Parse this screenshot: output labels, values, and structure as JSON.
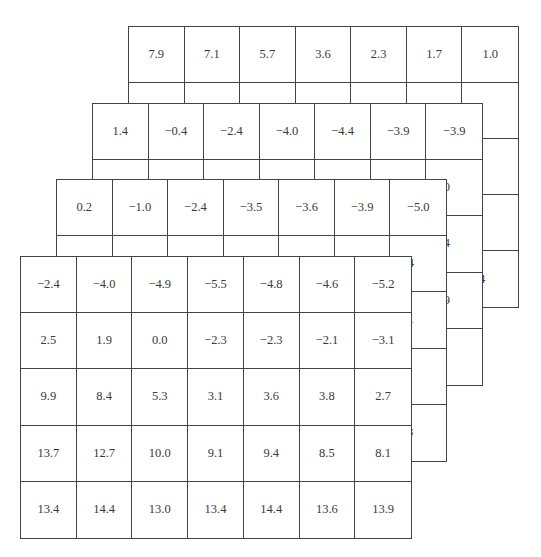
{
  "figure": {
    "layers": [
      {
        "name": "layer-1-back",
        "rows": [
          [
            "7.9",
            "7.1",
            "5.7",
            "3.6",
            "2.3",
            "1.7",
            "1.0"
          ],
          [
            "",
            "",
            "",
            "",
            "",
            "",
            "2.1"
          ],
          [
            "",
            "",
            "",
            "",
            "",
            "",
            "4.0"
          ],
          [
            "",
            "",
            "",
            "",
            "",
            "",
            "6.8"
          ],
          [
            "",
            "",
            "",
            "",
            "",
            "",
            "14.4"
          ]
        ]
      },
      {
        "name": "layer-2",
        "rows": [
          [
            "1.4",
            "−0.4",
            "−2.4",
            "−4.0",
            "−4.4",
            "−3.9",
            "−3.9"
          ],
          [
            "",
            "",
            "",
            "",
            "",
            "",
            "−6.0"
          ],
          [
            "",
            "",
            "",
            "",
            "",
            "",
            "−6.4"
          ],
          [
            "",
            "",
            "",
            "",
            "",
            "",
            "−2.9"
          ],
          [
            "",
            "",
            "",
            "",
            "",
            "",
            "6.6"
          ]
        ]
      },
      {
        "name": "layer-3",
        "rows": [
          [
            "0.2",
            "−1.0",
            "−2.4",
            "−3.5",
            "−3.6",
            "−3.9",
            "−5.0"
          ],
          [
            "",
            "",
            "",
            "",
            "",
            "",
            "−4.4"
          ],
          [
            "",
            "",
            "",
            "",
            "",
            "",
            "−1.1"
          ],
          [
            "",
            "",
            "",
            "",
            "",
            "",
            "2.9"
          ],
          [
            "",
            "",
            "",
            "",
            "",
            "",
            "10.3"
          ]
        ]
      },
      {
        "name": "layer-4-front",
        "rows": [
          [
            "−2.4",
            "−4.0",
            "−4.9",
            "−5.5",
            "−4.8",
            "−4.6",
            "−5.2"
          ],
          [
            "2.5",
            "1.9",
            "0.0",
            "−2.3",
            "−2.3",
            "−2.1",
            "−3.1"
          ],
          [
            "9.9",
            "8.4",
            "5.3",
            "3.1",
            "3.6",
            "3.8",
            "2.7"
          ],
          [
            "13.7",
            "12.7",
            "10.0",
            "9.1",
            "9.4",
            "8.5",
            "8.1"
          ],
          [
            "13.4",
            "14.4",
            "13.0",
            "13.4",
            "14.4",
            "13.6",
            "13.9"
          ]
        ]
      }
    ]
  },
  "chart_data": {
    "type": "table",
    "title": "",
    "note": "Stack of 4 layered 7x5 grids; only the first row and last column of back layers are visible",
    "tables": [
      {
        "layer": 1,
        "visible_first_row": [
          7.9,
          7.1,
          5.7,
          3.6,
          2.3,
          1.7,
          1.0
        ],
        "visible_last_column": [
          1.0,
          2.1,
          4.0,
          6.8,
          14.4
        ]
      },
      {
        "layer": 2,
        "visible_first_row": [
          1.4,
          -0.4,
          -2.4,
          -4.0,
          -4.4,
          -3.9,
          -3.9
        ],
        "visible_last_column": [
          -3.9,
          -6.0,
          -6.4,
          -2.9,
          6.6
        ]
      },
      {
        "layer": 3,
        "visible_first_row": [
          0.2,
          -1.0,
          -2.4,
          -3.5,
          -3.6,
          -3.9,
          -5.0
        ],
        "visible_last_column": [
          -5.0,
          -4.4,
          -1.1,
          2.9,
          10.3
        ]
      },
      {
        "layer": 4,
        "values": [
          [
            -2.4,
            -4.0,
            -4.9,
            -5.5,
            -4.8,
            -4.6,
            -5.2
          ],
          [
            2.5,
            1.9,
            0.0,
            -2.3,
            -2.3,
            -2.1,
            -3.1
          ],
          [
            9.9,
            8.4,
            5.3,
            3.1,
            3.6,
            3.8,
            2.7
          ],
          [
            13.7,
            12.7,
            10.0,
            9.1,
            9.4,
            8.5,
            8.1
          ],
          [
            13.4,
            14.4,
            13.0,
            13.4,
            14.4,
            13.6,
            13.9
          ]
        ]
      }
    ]
  }
}
